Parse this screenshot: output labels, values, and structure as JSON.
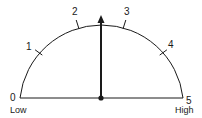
{
  "gauge": {
    "min": 0,
    "max": 5,
    "value": 2.5,
    "tick_labels": [
      "0",
      "1",
      "2",
      "3",
      "4",
      "5"
    ],
    "low_label": "Low",
    "high_label": "High",
    "needle_icon": "arrow-up-icon",
    "colors": {
      "stroke": "#1a1a1a",
      "background": "#ffffff"
    }
  }
}
